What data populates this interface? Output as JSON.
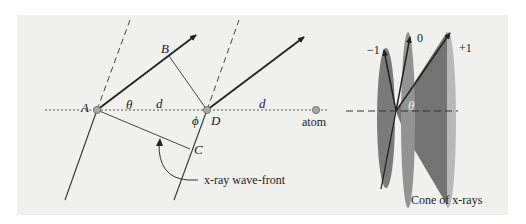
{
  "left_diagram": {
    "points": {
      "A": "A",
      "B": "B",
      "C": "C",
      "D": "D"
    },
    "angle_theta": "θ",
    "angle_phi": "ϕ",
    "spacing_1": "d",
    "spacing_2": "d",
    "atom_label": "atom",
    "wavefront_label": "x-ray wave-front"
  },
  "right_diagram": {
    "order_minus1": "−1",
    "order_0": "0",
    "order_plus1": "+1",
    "angle_theta": "θ",
    "caption": "Cone of x-rays"
  },
  "colors": {
    "panel_bg": "#f0f0ee",
    "line": "#333333",
    "atom_fill": "#a8a8a8",
    "cone_dark": "#6e6e6e",
    "cone_mid": "#8c8c8c",
    "cone_light": "#b4b4b4"
  }
}
